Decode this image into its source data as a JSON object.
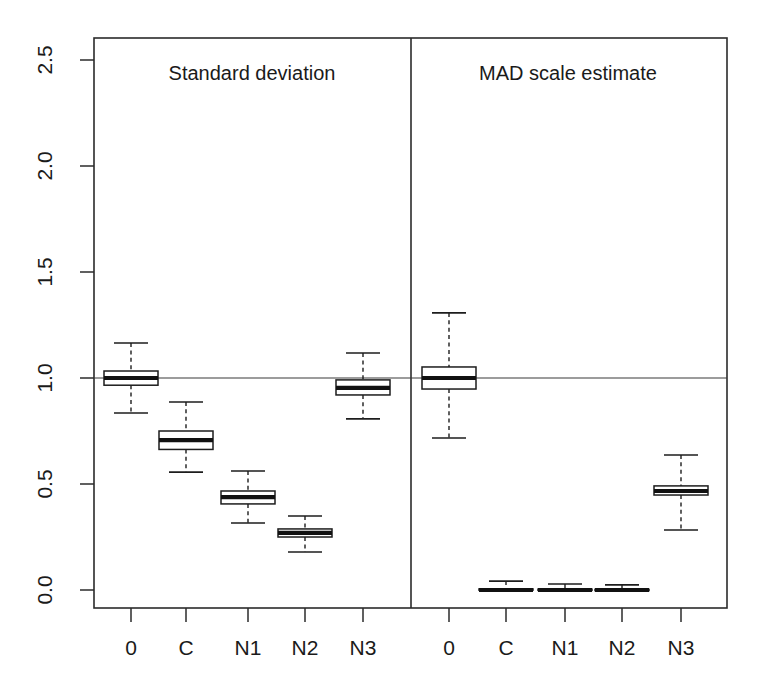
{
  "chart_data": {
    "type": "box",
    "title": "",
    "xlabel": "",
    "ylabel": "",
    "ylim": [
      0.0,
      2.6
    ],
    "yticks": [
      0.0,
      0.5,
      1.0,
      1.5,
      2.0,
      2.5
    ],
    "ytick_labels": [
      "0.0",
      "0.5",
      "1.0",
      "1.5",
      "2.0",
      "2.5"
    ],
    "grid": false,
    "legend": "none",
    "reference_line": {
      "y": 1.0,
      "label": ""
    },
    "categories": [
      "0",
      "C",
      "N1",
      "N2",
      "N3"
    ],
    "panels": [
      {
        "name": "left-panel",
        "title": "Standard deviation",
        "boxes": [
          {
            "category": "0",
            "whisker_low": 0.835,
            "q1": 0.966,
            "median": 1.0,
            "q3": 1.033,
            "whisker_high": 1.165
          },
          {
            "category": "C",
            "whisker_low": 0.556,
            "q1": 0.663,
            "median": 0.707,
            "q3": 0.75,
            "whisker_high": 0.887
          },
          {
            "category": "N1",
            "whisker_low": 0.316,
            "q1": 0.406,
            "median": 0.438,
            "q3": 0.467,
            "whisker_high": 0.561
          },
          {
            "category": "N2",
            "whisker_low": 0.179,
            "q1": 0.25,
            "median": 0.269,
            "q3": 0.288,
            "whisker_high": 0.349
          },
          {
            "category": "N3",
            "whisker_low": 0.807,
            "q1": 0.92,
            "median": 0.953,
            "q3": 0.991,
            "whisker_high": 1.118
          }
        ]
      },
      {
        "name": "right-panel",
        "title": "MAD scale estimate",
        "boxes": [
          {
            "category": "0",
            "whisker_low": 0.717,
            "q1": 0.948,
            "median": 1.0,
            "q3": 1.052,
            "whisker_high": 1.307
          },
          {
            "category": "C",
            "whisker_low": 0.0,
            "q1": 0.0,
            "median": 0.0,
            "q3": 0.005,
            "whisker_high": 0.042
          },
          {
            "category": "N1",
            "whisker_low": 0.0,
            "q1": 0.0,
            "median": 0.0,
            "q3": 0.004,
            "whisker_high": 0.028
          },
          {
            "category": "N2",
            "whisker_low": 0.0,
            "q1": 0.0,
            "median": 0.0,
            "q3": 0.003,
            "whisker_high": 0.024
          },
          {
            "category": "N3",
            "whisker_low": 0.283,
            "q1": 0.448,
            "median": 0.467,
            "q3": 0.491,
            "whisker_high": 0.637
          }
        ]
      }
    ]
  },
  "axis": {
    "y_tick_labels": [
      "2.5",
      "2.0",
      "1.5",
      "1.0",
      "0.5",
      "0.0"
    ],
    "x_tick_labels_left": [
      "0",
      "C",
      "N1",
      "N2",
      "N3"
    ],
    "x_tick_labels_right": [
      "0",
      "C",
      "N1",
      "N2",
      "N3"
    ]
  },
  "panel_titles": {
    "left": "Standard deviation",
    "right": "MAD scale estimate"
  },
  "colors": {
    "axis": "#2b2b2b",
    "box_fill": "#ffffff",
    "box_stroke": "#1d1d1d",
    "median": "#111111",
    "reference_line": "#3a3a3a",
    "background": "#ffffff"
  }
}
